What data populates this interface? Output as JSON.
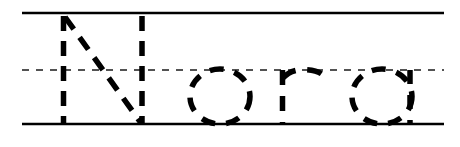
{
  "worksheet": {
    "type": "handwriting-tracing-worksheet",
    "word": "Nora",
    "script_style": "print-manuscript",
    "trace_style": "dashed-outline",
    "background_color": "#ffffff",
    "ink_color": "#000000",
    "canvas": {
      "width": 460,
      "height": 147
    },
    "guide_lines": {
      "top": {
        "label": "top-line",
        "style": "solid",
        "y": 13,
        "x_start": 22,
        "x_end": 444,
        "thickness": 2.6,
        "color": "#000000"
      },
      "middle": {
        "label": "midline-dotted",
        "style": "dashed",
        "y": 70,
        "x_start": 22,
        "x_end": 444,
        "thickness": 1.5,
        "color": "#1a1a1a",
        "dash": "7 7"
      },
      "bottom": {
        "label": "baseline",
        "style": "solid",
        "y": 124,
        "x_start": 22,
        "x_end": 444,
        "thickness": 2.6,
        "color": "#000000"
      }
    },
    "letters": [
      {
        "char": "N",
        "case": "uppercase",
        "index": 0,
        "x_left": 62,
        "x_right": 143,
        "top": 16,
        "bottom": 124,
        "stroke_width": 5.5,
        "dash_pattern": "15 10",
        "strokes": [
          {
            "name": "left-stem",
            "type": "line",
            "x1": 63.5,
            "y1": 16,
            "x2": 63.5,
            "y2": 124
          },
          {
            "name": "diagonal",
            "type": "line",
            "x1": 65,
            "y1": 17,
            "x2": 141,
            "y2": 123
          },
          {
            "name": "right-stem",
            "type": "line",
            "x1": 142,
            "y1": 16,
            "x2": 142,
            "y2": 124
          }
        ]
      },
      {
        "char": "o",
        "case": "lowercase",
        "index": 1,
        "x_left": 190,
        "x_right": 250,
        "top": 69,
        "bottom": 124,
        "stroke_width": 5.5,
        "dash_pattern": "14 11",
        "strokes": [
          {
            "name": "bowl",
            "type": "ellipse",
            "cx": 220,
            "cy": 96.5,
            "rx": 30,
            "ry": 27.5
          }
        ]
      },
      {
        "char": "r",
        "case": "lowercase",
        "index": 2,
        "x_left": 281,
        "x_right": 324,
        "top": 69,
        "bottom": 124,
        "stroke_width": 5.5,
        "dash_pattern": "15 11",
        "strokes": [
          {
            "name": "stem",
            "type": "line",
            "x1": 282.5,
            "y1": 70,
            "x2": 282.5,
            "y2": 124
          },
          {
            "name": "shoulder-arc",
            "type": "path",
            "d": "M 283 78 Q 290 70 303 69.5 Q 317 69.5 323 75"
          }
        ]
      },
      {
        "char": "a",
        "case": "lowercase",
        "index": 3,
        "x_left": 352,
        "x_right": 412,
        "top": 69,
        "bottom": 124,
        "stroke_width": 5.5,
        "dash_pattern": "14 11",
        "strokes": [
          {
            "name": "bowl",
            "type": "ellipse",
            "cx": 382,
            "cy": 96.5,
            "rx": 30,
            "ry": 27.5
          },
          {
            "name": "right-stem",
            "type": "line",
            "x1": 410,
            "y1": 70,
            "x2": 410,
            "y2": 124
          }
        ]
      }
    ]
  }
}
